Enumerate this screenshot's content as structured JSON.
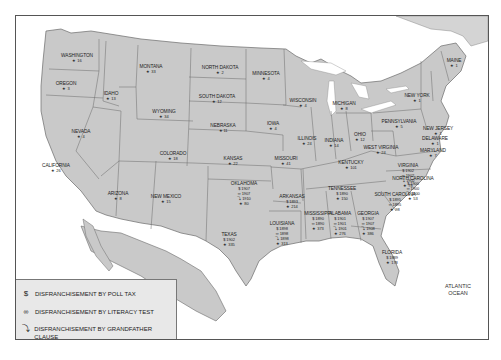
{
  "map": {
    "oceans": {
      "pacific": "PACIFIC\nOCEAN",
      "atlantic": "ATLANTIC\nOCEAN"
    },
    "states": [
      {
        "name": "WASHINGTON",
        "lynchings": "16",
        "x": 76,
        "y": 52
      },
      {
        "name": "OREGON",
        "lynchings": "3",
        "x": 65,
        "y": 80
      },
      {
        "name": "IDAHO",
        "lynchings": "13",
        "x": 110,
        "y": 90
      },
      {
        "name": "MONTANA",
        "lynchings": "33",
        "x": 150,
        "y": 63
      },
      {
        "name": "WYOMING",
        "lynchings": "34",
        "x": 163,
        "y": 108
      },
      {
        "name": "NEVADA",
        "lynchings": "4",
        "x": 80,
        "y": 128
      },
      {
        "name": "CALIFORNIA",
        "lynchings": "26",
        "x": 55,
        "y": 162
      },
      {
        "name": "COLORADO",
        "lynchings": "18",
        "x": 172,
        "y": 150
      },
      {
        "name": "ARIZONA",
        "lynchings": "8",
        "x": 117,
        "y": 190
      },
      {
        "name": "NEW MEXICO",
        "lynchings": "15",
        "x": 165,
        "y": 193
      },
      {
        "name": "NORTH DAKOTA",
        "lynchings": "2",
        "x": 219,
        "y": 64
      },
      {
        "name": "SOUTH DAKOTA",
        "lynchings": "12",
        "x": 216,
        "y": 93
      },
      {
        "name": "NEBRASKA",
        "lynchings": "11",
        "x": 222,
        "y": 122
      },
      {
        "name": "KANSAS",
        "lynchings": "22",
        "x": 232,
        "y": 155
      },
      {
        "name": "MINNESOTA",
        "lynchings": "4",
        "x": 265,
        "y": 70
      },
      {
        "name": "IOWA",
        "lynchings": "4",
        "x": 272,
        "y": 120
      },
      {
        "name": "WISCONSIN",
        "lynchings": "4",
        "x": 302,
        "y": 97
      },
      {
        "name": "MISSOURI",
        "lynchings": "41",
        "x": 285,
        "y": 155
      },
      {
        "name": "ILLINOIS",
        "lynchings": "24",
        "x": 306,
        "y": 135
      },
      {
        "name": "MICHIGAN",
        "lynchings": "8",
        "x": 343,
        "y": 100
      },
      {
        "name": "INDIANA",
        "lynchings": "14",
        "x": 333,
        "y": 137
      },
      {
        "name": "OHIO",
        "lynchings": "12",
        "x": 359,
        "y": 131
      },
      {
        "name": "KENTUCKY",
        "lynchings": "101",
        "x": 350,
        "y": 159
      },
      {
        "name": "WEST VIRGINIA",
        "lynchings": "24",
        "x": 380,
        "y": 144
      },
      {
        "name": "PENNSYLVANIA",
        "lynchings": "5",
        "x": 398,
        "y": 118
      },
      {
        "name": "NEW YORK",
        "lynchings": "1",
        "x": 416,
        "y": 92
      },
      {
        "name": "MAINE",
        "lynchings": "1",
        "x": 453,
        "y": 57
      },
      {
        "name": "NEW JERSEY",
        "lynchings": "1",
        "x": 437,
        "y": 125
      },
      {
        "name": "DELAWARE",
        "lynchings": "1",
        "x": 434,
        "y": 135
      },
      {
        "name": "MARYLAND",
        "lynchings": "7",
        "x": 432,
        "y": 147
      },
      {
        "name": "TENNESSEE",
        "lynchings": "150",
        "x": 341,
        "y": 185
      },
      {
        "name": "OKLAHOMA",
        "lynchings": "80",
        "x": 243,
        "y": 180
      },
      {
        "name": "ARKANSAS",
        "lynchings": "214",
        "x": 291,
        "y": 193
      },
      {
        "name": "TEXAS",
        "lynchings": "335",
        "x": 228,
        "y": 231
      },
      {
        "name": "LOUISIANA",
        "lynchings": "313",
        "x": 281,
        "y": 220
      },
      {
        "name": "MISSISSIPPI",
        "lynchings": "373",
        "x": 317,
        "y": 210
      },
      {
        "name": "ALABAMA",
        "lynchings": "276",
        "x": 339,
        "y": 210
      },
      {
        "name": "GEORGIA",
        "lynchings": "386",
        "x": 367,
        "y": 210
      },
      {
        "name": "FLORIDA",
        "lynchings": "178",
        "x": 391,
        "y": 249
      },
      {
        "name": "VIRGINIA",
        "lynchings": "78",
        "x": 407,
        "y": 162
      },
      {
        "name": "NORTH CAROLINA",
        "lynchings": "53",
        "x": 412,
        "y": 175
      },
      {
        "name": "SOUTH CAROLINA",
        "lynchings": "98",
        "x": 394,
        "y": 191
      }
    ],
    "disfranchisement": {
      "OKLAHOMA": {
        "poll_tax": "1907",
        "literacy": "1907",
        "grandfather": "1910"
      },
      "ARKANSAS": {
        "poll_tax": "1893"
      },
      "TEXAS": {
        "poll_tax": "1902"
      },
      "LOUISIANA": {
        "poll_tax": "1898",
        "literacy": "1898",
        "grandfather": "1898"
      },
      "MISSISSIPPI": {
        "poll_tax": "1890",
        "literacy": "1890"
      },
      "ALABAMA": {
        "poll_tax": "1901",
        "literacy": "1901",
        "grandfather": "1901"
      },
      "GEORGIA": {
        "poll_tax": "1907",
        "literacy": "1907",
        "grandfather": "1908"
      },
      "FLORIDA": {
        "poll_tax": "1889"
      },
      "TENNESSEE": {
        "poll_tax": "1890"
      },
      "VIRGINIA": {
        "poll_tax": "1902",
        "literacy": "1902",
        "grandfather": "1902"
      },
      "NORTH CAROLINA": {
        "poll_tax": "1900",
        "literacy": "1900",
        "grandfather": "1900"
      },
      "SOUTH CAROLINA": {
        "poll_tax": "1895",
        "literacy": "1895"
      }
    }
  },
  "legend": {
    "items": [
      {
        "icon": "$",
        "label": "DISFRANCHISEMENT BY POLL TAX"
      },
      {
        "icon": "෴",
        "label": "DISFRANCHISEMENT BY LITERACY TEST"
      },
      {
        "icon": "⤵",
        "label": "DISFRANCHISEMENT BY GRANDFATHER CLAUSE"
      },
      {
        "icon": "★",
        "label": "NUMBER OF LYNCHINGS (1889-1918)"
      }
    ]
  },
  "colors": {
    "land": "#c9c9c9",
    "border": "#6a6a6a",
    "water": "#ffffff",
    "legend_bg": "#e8e8e8"
  }
}
